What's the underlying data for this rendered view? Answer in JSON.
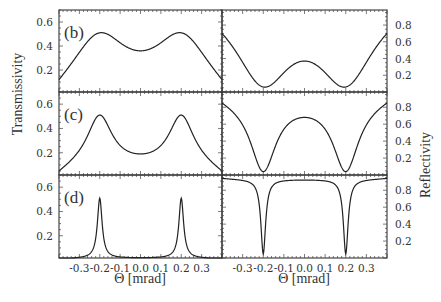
{
  "chart_data": {
    "type": "line",
    "layout": "3 rows x 2 columns, shared x-axis, left column Transmissivity, right column Reflectivity",
    "xlabel": "Θ [mrad]",
    "ylabel_left": "Transmissivity",
    "ylabel_right": "Reflectivity",
    "xlim": [
      -0.4,
      0.4
    ],
    "x_ticks": [
      "-0.3",
      "-0.2",
      "-0.1",
      "0.0",
      "0.1",
      "0.2",
      "0.3"
    ],
    "x_tick_values": [
      -0.3,
      -0.2,
      -0.1,
      0.0,
      0.1,
      0.2,
      0.3
    ],
    "ylim_left": [
      0.017,
      0.7
    ],
    "y_ticks_left": [
      "0.2",
      "0.4",
      "0.6"
    ],
    "y_tick_values_left": [
      0.2,
      0.4,
      0.6
    ],
    "ylim_right": [
      0.0,
      0.98
    ],
    "y_ticks_right": [
      "0.2",
      "0.4",
      "0.6",
      "0.8"
    ],
    "y_tick_values_right": [
      0.2,
      0.4,
      0.6,
      0.8
    ],
    "grid": false,
    "panels": [
      {
        "label": "(b)",
        "transmissivity": {
          "edge_value": 0.12,
          "peak_positions": [
            -0.2,
            0.2
          ],
          "peak_value": 0.51,
          "center_value": 0.36,
          "width": 0.16
        },
        "reflectivity": {
          "edge_value": 0.7,
          "dip_positions": [
            -0.2,
            0.2
          ],
          "dip_value": 0.06,
          "center_value": 0.37,
          "width": 0.16
        }
      },
      {
        "label": "(c)",
        "transmissivity": {
          "edge_value": 0.05,
          "peak_positions": [
            -0.2,
            0.2
          ],
          "peak_value": 0.51,
          "center_value": 0.19,
          "width": 0.075
        },
        "reflectivity": {
          "edge_value": 0.85,
          "dip_positions": [
            -0.2,
            0.2
          ],
          "dip_value": 0.04,
          "center_value": 0.68,
          "width": 0.075
        }
      },
      {
        "label": "(d)",
        "transmissivity": {
          "edge_value": 0.01,
          "peak_positions": [
            -0.2,
            0.2
          ],
          "peak_value": 0.51,
          "center_value": 0.02,
          "width": 0.014
        },
        "reflectivity": {
          "edge_value": 0.94,
          "dip_positions": [
            -0.2,
            0.2
          ],
          "dip_value": 0.05,
          "center_value": 0.92,
          "width": 0.014
        }
      }
    ]
  }
}
